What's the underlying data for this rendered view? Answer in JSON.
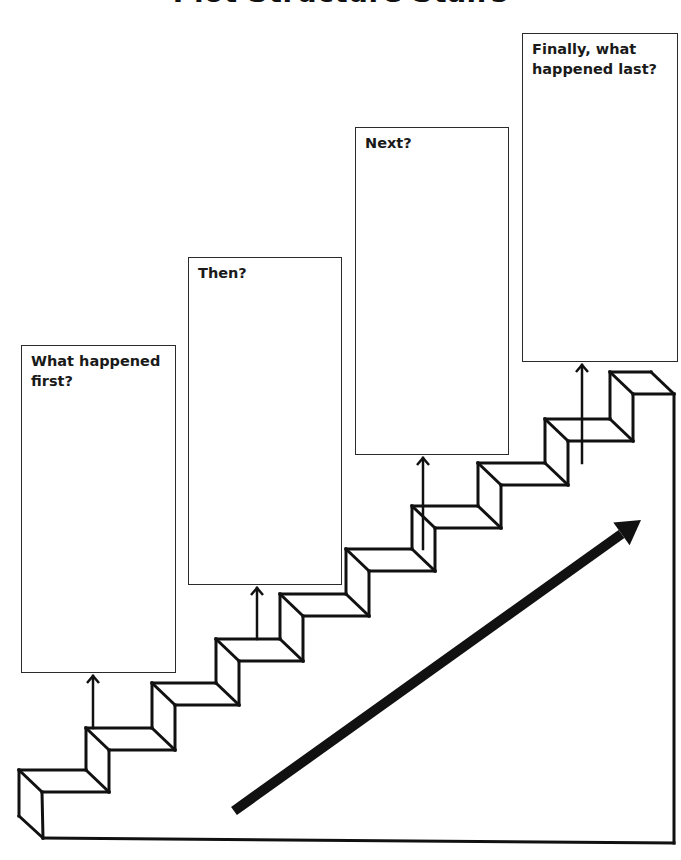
{
  "title": "Plot Structure Stairs",
  "boxes": [
    {
      "id": "first",
      "label": "What happened first?",
      "left": 21,
      "top": 345,
      "right": 176,
      "bottom": 673,
      "arrow_x": 93
    },
    {
      "id": "then",
      "label": "Then?",
      "left": 188,
      "top": 257,
      "right": 342,
      "bottom": 585,
      "arrow_x": 257
    },
    {
      "id": "next",
      "label": "Next?",
      "left": 355,
      "top": 127,
      "right": 509,
      "bottom": 455,
      "arrow_x": 423
    },
    {
      "id": "last",
      "label": "Finally, what happened last?",
      "left": 522,
      "top": 33,
      "right": 678,
      "bottom": 362,
      "arrow_x": 582
    }
  ],
  "stairs": {
    "stroke": "#111111",
    "stroke_width": 3,
    "depth_dx": 23,
    "depth_dy": 22,
    "treads": [
      {
        "x": 19,
        "y": 770
      },
      {
        "x": 86,
        "y": 728
      },
      {
        "x": 152,
        "y": 683
      },
      {
        "x": 216,
        "y": 639
      },
      {
        "x": 280,
        "y": 594
      },
      {
        "x": 346,
        "y": 549
      },
      {
        "x": 412,
        "y": 506
      },
      {
        "x": 478,
        "y": 463
      },
      {
        "x": 545,
        "y": 419
      },
      {
        "x": 610,
        "y": 372
      }
    ],
    "top_back_right_x": 651,
    "right_wall_x": 674,
    "base_bottom_left": {
      "x": 43,
      "y": 838
    },
    "base_bottom_right": {
      "x": 674,
      "y": 843
    },
    "back_bottom_left": {
      "x": 19,
      "y": 816
    }
  },
  "progress_arrow": {
    "color": "#111111",
    "width": 10,
    "tail": {
      "x": 234,
      "y": 811
    },
    "tip": {
      "x": 641,
      "y": 520
    }
  }
}
